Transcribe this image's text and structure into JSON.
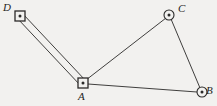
{
  "figure": {
    "kind": "survey-network-diagram",
    "width": 217,
    "height": 106,
    "background_color": "#f2f1ef",
    "ink_color": "#2b2a29"
  },
  "points": [
    {
      "id": "D",
      "label": "D",
      "marker": "square-with-center-dot",
      "x": 20,
      "y": 16,
      "label_position": "upper-left"
    },
    {
      "id": "A",
      "label": "A",
      "marker": "square-with-center-dot",
      "x": 83,
      "y": 83,
      "label_position": "below"
    },
    {
      "id": "C",
      "label": "C",
      "marker": "circle-with-center-dot",
      "x": 169,
      "y": 15,
      "label_position": "upper-right"
    },
    {
      "id": "B",
      "label": "B",
      "marker": "circle-with-center-dot",
      "x": 202,
      "y": 92,
      "label_position": "right"
    }
  ],
  "edges": [
    {
      "id": "DA",
      "from": "D",
      "to": "A",
      "style": "double-line"
    },
    {
      "id": "AC",
      "from": "A",
      "to": "C",
      "style": "single-line"
    },
    {
      "id": "CB",
      "from": "C",
      "to": "B",
      "style": "single-line"
    },
    {
      "id": "AB",
      "from": "A",
      "to": "B",
      "style": "single-line"
    }
  ]
}
